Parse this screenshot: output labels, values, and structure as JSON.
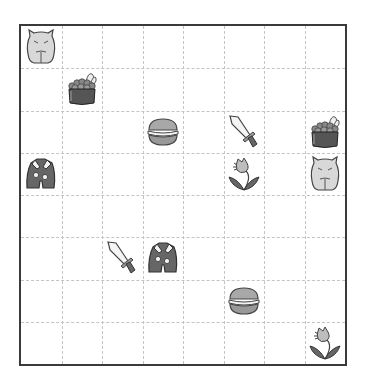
{
  "board": {
    "rows": 8,
    "cols": 8,
    "colors": {
      "border": "#3a3a3a",
      "gridline": "#c4c4c4",
      "background": "#ffffff"
    },
    "items": [
      {
        "row": 0,
        "col": 0,
        "type": "capybara",
        "icon": "capybara-icon"
      },
      {
        "row": 1,
        "col": 1,
        "type": "caviar-basket",
        "icon": "caviar-basket-icon"
      },
      {
        "row": 2,
        "col": 3,
        "type": "macaron",
        "icon": "macaron-icon"
      },
      {
        "row": 2,
        "col": 5,
        "type": "sword",
        "icon": "sword-icon"
      },
      {
        "row": 2,
        "col": 7,
        "type": "caviar-basket",
        "icon": "caviar-basket-icon"
      },
      {
        "row": 3,
        "col": 0,
        "type": "jacket",
        "icon": "jacket-icon"
      },
      {
        "row": 3,
        "col": 5,
        "type": "flower",
        "icon": "flower-icon"
      },
      {
        "row": 3,
        "col": 7,
        "type": "capybara",
        "icon": "capybara-icon"
      },
      {
        "row": 5,
        "col": 2,
        "type": "sword",
        "icon": "sword-icon"
      },
      {
        "row": 5,
        "col": 3,
        "type": "jacket",
        "icon": "jacket-icon"
      },
      {
        "row": 6,
        "col": 5,
        "type": "macaron",
        "icon": "macaron-icon"
      },
      {
        "row": 7,
        "col": 7,
        "type": "flower",
        "icon": "flower-icon"
      }
    ]
  }
}
